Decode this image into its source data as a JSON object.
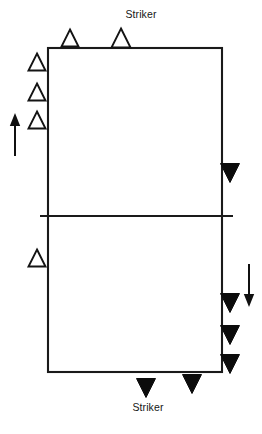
{
  "diagram": {
    "court": {
      "name": "court-rectangle",
      "left": 48,
      "top": 48,
      "right": 222,
      "bottom": 372,
      "center_line_y": 216,
      "center_line_left": 40,
      "center_line_right": 233,
      "stroke_color": "#1a1a1a"
    },
    "labels": [
      {
        "id": "striker-top",
        "text": "Striker",
        "x": 141,
        "y": 18,
        "anchor": "middle"
      },
      {
        "id": "striker-bottom",
        "text": "Striker",
        "x": 148,
        "y": 411,
        "anchor": "middle"
      }
    ],
    "open_triangles": [
      {
        "id": "open-top-left",
        "cx": 70,
        "cy": 38,
        "size": 17
      },
      {
        "id": "open-top-striker",
        "cx": 121,
        "cy": 38,
        "size": 19
      },
      {
        "id": "open-left-1",
        "cx": 37,
        "cy": 62,
        "size": 17
      },
      {
        "id": "open-left-2",
        "cx": 37,
        "cy": 92,
        "size": 17
      },
      {
        "id": "open-left-3",
        "cx": 37,
        "cy": 120,
        "size": 17
      },
      {
        "id": "open-left-4",
        "cx": 37,
        "cy": 258,
        "size": 17
      }
    ],
    "filled_triangles": [
      {
        "id": "filled-right-1",
        "cx": 230,
        "cy": 173,
        "size": 19
      },
      {
        "id": "filled-right-2",
        "cx": 230,
        "cy": 303,
        "size": 19
      },
      {
        "id": "filled-right-3",
        "cx": 230,
        "cy": 335,
        "size": 19
      },
      {
        "id": "filled-right-4",
        "cx": 230,
        "cy": 364,
        "size": 19
      },
      {
        "id": "filled-bottom-striker",
        "cx": 146,
        "cy": 388,
        "size": 19
      },
      {
        "id": "filled-bottom-right",
        "cx": 192,
        "cy": 384,
        "size": 19
      }
    ],
    "arrows": [
      {
        "id": "arrow-up-left",
        "direction": "up",
        "x": 15,
        "y_top": 114,
        "y_bottom": 156
      },
      {
        "id": "arrow-down-right",
        "direction": "down",
        "x": 249,
        "y_top": 264,
        "y_bottom": 306
      }
    ],
    "colors": {
      "line": "#1a1a1a",
      "fill_marker": "#0b0b0b",
      "open_marker_fill": "#ffffff",
      "background": "#ffffff",
      "text": "#161616"
    }
  }
}
